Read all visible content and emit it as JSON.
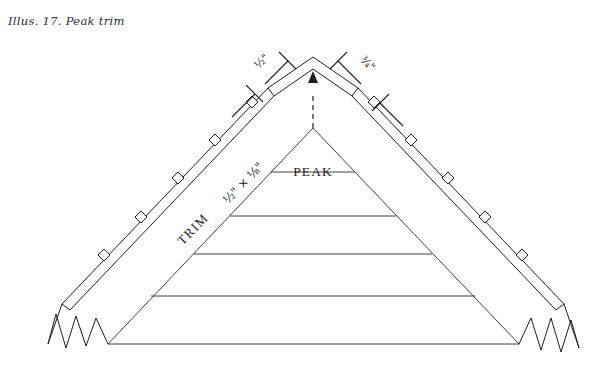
{
  "figure": {
    "caption": "Illus. 17.  Peak trim",
    "type": "technical-line-drawing",
    "background_color": "#ffffff",
    "line_color": "#1e1e1e"
  },
  "labels": {
    "peak": "PEAK",
    "trim": "TRIM",
    "trim_size": "½\" × ⅛\"",
    "dimension_left": "½\"",
    "dimension_right": "¾\""
  },
  "callouts": [
    {
      "name": "peak-callout",
      "text": "PEAK",
      "leader": "vertical line up to roof apex underside"
    },
    {
      "name": "trim-callout",
      "text": "TRIM",
      "leader": "text set along left rafter trim board"
    },
    {
      "name": "trim-size-callout",
      "text": "½\" × ⅛\"",
      "leader": "text set along left rafter beside TRIM"
    }
  ],
  "dimensions": [
    {
      "name": "left-peak-cap-dimension",
      "value": "½\"",
      "side": "left",
      "style": "diagonal dimension line with perpendicular end ticks"
    },
    {
      "name": "right-peak-cap-dimension",
      "value": "¾\"",
      "side": "right",
      "style": "diagonal dimension line with perpendicular end ticks"
    }
  ],
  "structure": {
    "apex_marker": "dashed leader with arrowhead pointing up to peak cap",
    "course_lines_count": 5,
    "break_symbols_count": 2,
    "break_symbol_note": "zigzag break lines at both lower rafter ends",
    "trim_tabs_per_side": 5
  }
}
